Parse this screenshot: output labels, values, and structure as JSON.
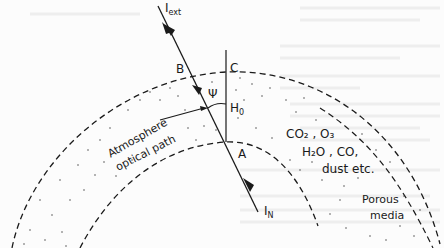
{
  "diagram": {
    "labels": {
      "incident": "I",
      "incident_sub": "ext",
      "transmitted": "I",
      "transmitted_sub": "N",
      "point_b": "B",
      "point_c": "C",
      "point_a": "A",
      "angle": "Ψ",
      "height": "H",
      "height_sub": "0",
      "path_line1": "Atmosphere",
      "path_line2": "optical path",
      "gases_line1": "CO₂ , O₃",
      "gases_line2": "H₂O , CO,",
      "gases_line3": "dust etc.",
      "media_line1": "Porous",
      "media_line2": "media"
    },
    "colors": {
      "ink": "#1a1a1a",
      "paper": "#fcfcfc",
      "ghost_text": "#ececec"
    }
  }
}
